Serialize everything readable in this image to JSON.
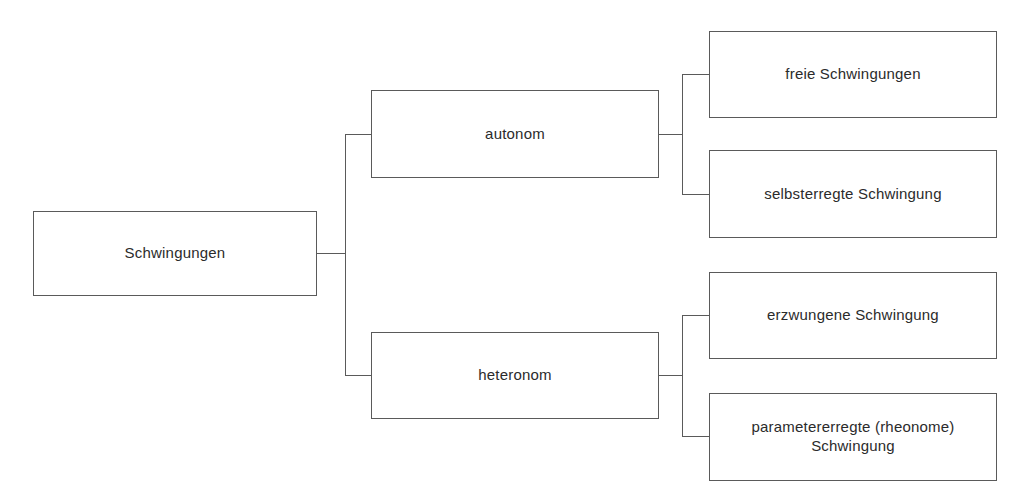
{
  "diagram": {
    "type": "tree",
    "line_color": "#5a5a5a",
    "background_color": "#ffffff",
    "text_color": "#2b2b2b",
    "nodes": {
      "root": {
        "id": "schwingungen",
        "label": "Schwingungen",
        "level": 0
      },
      "branch_top": {
        "id": "autonom",
        "label": "autonom",
        "level": 1
      },
      "branch_bottom": {
        "id": "heteronom",
        "label": "heteronom",
        "level": 1
      },
      "leaf_1": {
        "id": "freie-schwingungen",
        "label": "freie Schwingungen",
        "level": 2,
        "parent": "autonom"
      },
      "leaf_2": {
        "id": "selbsterregte-schwingung",
        "label": "selbsterregte Schwingung",
        "level": 2,
        "parent": "autonom"
      },
      "leaf_3": {
        "id": "erzwungene-schwingung",
        "label": "erzwungene Schwingung",
        "level": 2,
        "parent": "heteronom"
      },
      "leaf_4": {
        "id": "parametererregte-schwingung",
        "label": "parametererregte (rheonome)\nSchwingung",
        "level": 2,
        "parent": "heteronom"
      }
    },
    "edges": [
      {
        "from": "schwingungen",
        "to": "autonom"
      },
      {
        "from": "schwingungen",
        "to": "heteronom"
      },
      {
        "from": "autonom",
        "to": "freie-schwingungen"
      },
      {
        "from": "autonom",
        "to": "selbsterregte-schwingung"
      },
      {
        "from": "heteronom",
        "to": "erzwungene-schwingung"
      },
      {
        "from": "heteronom",
        "to": "parametererregte-schwingung"
      }
    ]
  }
}
